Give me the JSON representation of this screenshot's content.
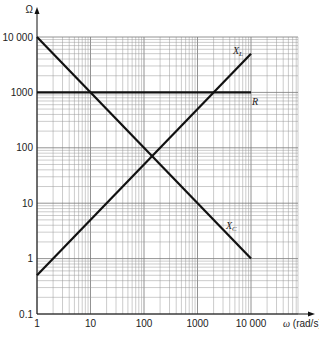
{
  "chart_data": {
    "type": "line",
    "title": "",
    "xlabel": "ω (rad/s)",
    "ylabel": "Ω",
    "xscale": "log",
    "yscale": "log",
    "xlim": [
      1,
      80000
    ],
    "ylim": [
      0.1,
      10000
    ],
    "grid": true,
    "x_ticks": [
      1,
      10,
      100,
      1000,
      10000
    ],
    "x_tick_labels": [
      "1",
      "10",
      "100",
      "1000",
      "10 000"
    ],
    "y_ticks": [
      0.1,
      1,
      10,
      100,
      1000,
      10000
    ],
    "y_tick_labels": [
      "0.1",
      "1",
      "10",
      "100",
      "1000",
      "10 000"
    ],
    "series": [
      {
        "name": "XL",
        "label_main": "X",
        "label_sub": "L",
        "x": [
          1,
          10000
        ],
        "values": [
          0.5,
          5000
        ]
      },
      {
        "name": "R",
        "label_main": "R",
        "label_sub": "",
        "x": [
          1,
          10000
        ],
        "values": [
          1000,
          1000
        ]
      },
      {
        "name": "XC",
        "label_main": "X",
        "label_sub": "C",
        "x": [
          1,
          10000
        ],
        "values": [
          10000,
          1
        ]
      }
    ],
    "annotations": [
      {
        "text": "XL = XC crossover",
        "x": 141,
        "y": 70.7
      },
      {
        "text": "XL = R",
        "x": 2000,
        "y": 1000
      },
      {
        "text": "XC = R",
        "x": 10,
        "y": 1000
      }
    ]
  },
  "axes": {
    "y_unit": "Ω",
    "x_unit_symbol": "ω",
    "x_unit_text": "(rad/s)"
  }
}
